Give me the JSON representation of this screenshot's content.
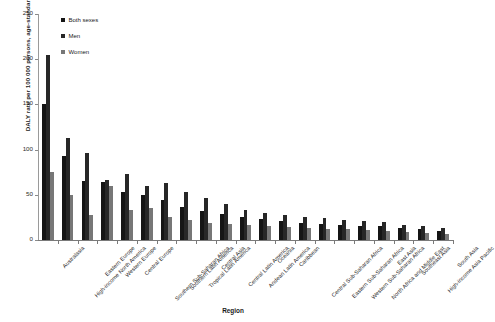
{
  "chart_data": {
    "type": "bar",
    "title": "",
    "xlabel": "Region",
    "ylabel": "DALY rate per 100 000 persons, age-standardised",
    "ylim": [
      0,
      250
    ],
    "yticks": [
      0,
      50,
      100,
      150,
      200,
      250
    ],
    "grid": false,
    "legend_position": "top-left",
    "categories": [
      "Australasia",
      "High-income North America",
      "Eastern Europe",
      "Western Europe",
      "Central Europe",
      "Southern Sub-Saharan Africa",
      "Southern Latin America",
      "Tropical Latin America",
      "Central Asia",
      "Central Latin America",
      "Andean Latin America",
      "Oceania",
      "Caribbean",
      "Central Sub-Saharan Africa",
      "Eastern Sub-Saharan Africa",
      "Western Sub-Saharan Africa",
      "North Africa and Middle East",
      "East Asia",
      "Southeast Asia",
      "High-income Asia Pacific",
      "South Asia"
    ],
    "series": [
      {
        "name": "Both sexes",
        "color": "#151515",
        "values": [
          150,
          93,
          65,
          64,
          53,
          50,
          44,
          37,
          32,
          29,
          25,
          23,
          21,
          19,
          18,
          17,
          16,
          15,
          13,
          12,
          10
        ]
      },
      {
        "name": "Men",
        "color": "#272727",
        "values": [
          205,
          113,
          96,
          66,
          73,
          60,
          63,
          53,
          47,
          40,
          33,
          30,
          28,
          26,
          24,
          22,
          21,
          20,
          17,
          16,
          13
        ]
      },
      {
        "name": "Women",
        "color": "#777777",
        "values": [
          75,
          50,
          28,
          60,
          33,
          35,
          26,
          22,
          19,
          18,
          17,
          15,
          14,
          13,
          12,
          12,
          11,
          10,
          9,
          8,
          7
        ]
      }
    ]
  },
  "legend": {
    "items": [
      {
        "label": "Both sexes"
      },
      {
        "label": "Men"
      },
      {
        "label": "Women"
      }
    ]
  },
  "axes": {
    "y_title": "DALY rate per 100 000 persons, age-standardised",
    "x_title": "Region",
    "y_tick_labels": [
      "250",
      "200",
      "150",
      "100",
      "50",
      "0"
    ]
  }
}
